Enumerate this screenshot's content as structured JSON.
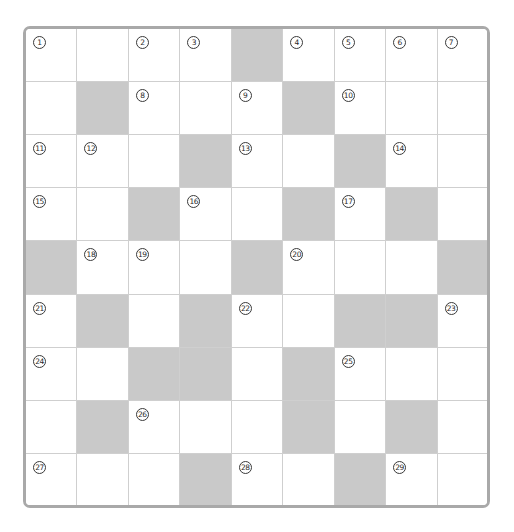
{
  "puzzle": {
    "type": "crossword",
    "rows": 9,
    "cols": 9,
    "colors": {
      "block": "#c9c9c9",
      "cell": "#ffffff",
      "frame": "#a9a9a9",
      "gridline": "#cfcfcf",
      "number": "#2a2a2a"
    },
    "grid": [
      [
        {
          "n": "1"
        },
        {
          "n": ""
        },
        {
          "n": "2"
        },
        {
          "n": "3"
        },
        {
          "b": true
        },
        {
          "n": "4"
        },
        {
          "n": "5"
        },
        {
          "n": "6"
        },
        {
          "n": "7"
        }
      ],
      [
        {
          "n": ""
        },
        {
          "b": true
        },
        {
          "n": "8"
        },
        {
          "n": ""
        },
        {
          "n": "9"
        },
        {
          "b": true
        },
        {
          "n": "10"
        },
        {
          "n": ""
        },
        {
          "n": ""
        }
      ],
      [
        {
          "n": "11"
        },
        {
          "n": "12"
        },
        {
          "n": ""
        },
        {
          "b": true
        },
        {
          "n": "13"
        },
        {
          "n": ""
        },
        {
          "b": true
        },
        {
          "n": "14"
        },
        {
          "n": ""
        }
      ],
      [
        {
          "n": "15"
        },
        {
          "n": ""
        },
        {
          "b": true
        },
        {
          "n": "16"
        },
        {
          "n": ""
        },
        {
          "b": true
        },
        {
          "n": "17"
        },
        {
          "b": true
        },
        {
          "n": ""
        }
      ],
      [
        {
          "b": true
        },
        {
          "n": "18"
        },
        {
          "n": "19"
        },
        {
          "n": ""
        },
        {
          "b": true
        },
        {
          "n": "20"
        },
        {
          "n": ""
        },
        {
          "n": ""
        },
        {
          "b": true
        }
      ],
      [
        {
          "n": "21"
        },
        {
          "b": true
        },
        {
          "n": ""
        },
        {
          "b": true
        },
        {
          "n": "22"
        },
        {
          "n": ""
        },
        {
          "b": true
        },
        {
          "b": true
        },
        {
          "n": "23"
        }
      ],
      [
        {
          "n": "24"
        },
        {
          "n": ""
        },
        {
          "b": true
        },
        {
          "b": true
        },
        {
          "n": ""
        },
        {
          "b": true
        },
        {
          "n": "25"
        },
        {
          "n": ""
        },
        {
          "n": ""
        }
      ],
      [
        {
          "n": ""
        },
        {
          "b": true
        },
        {
          "n": "26"
        },
        {
          "n": ""
        },
        {
          "n": ""
        },
        {
          "b": true
        },
        {
          "n": ""
        },
        {
          "b": true
        },
        {
          "n": ""
        }
      ],
      [
        {
          "n": "27"
        },
        {
          "n": ""
        },
        {
          "n": ""
        },
        {
          "b": true
        },
        {
          "n": "28"
        },
        {
          "n": ""
        },
        {
          "b": true
        },
        {
          "n": "29"
        },
        {
          "n": ""
        }
      ]
    ]
  }
}
